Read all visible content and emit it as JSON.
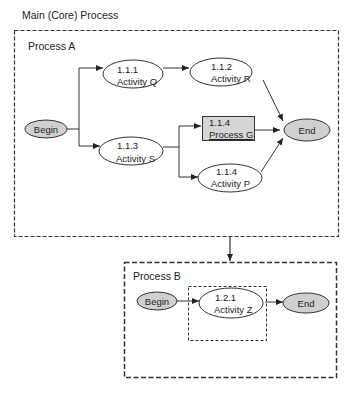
{
  "title": "Main (Core) Process",
  "process_a": {
    "label": "Process A",
    "begin": "Begin",
    "end": "End",
    "nodes": [
      {
        "id": "1.1.1",
        "label": "Activity Q",
        "shape": "ellipse"
      },
      {
        "id": "1.1.2",
        "label": "Activity R",
        "shape": "ellipse"
      },
      {
        "id": "1.1.3",
        "label": "Activity S",
        "shape": "ellipse"
      },
      {
        "id": "1.1.4",
        "label": "Process G",
        "shape": "rectangle"
      },
      {
        "id": "1.1.4",
        "label": "Activity P",
        "shape": "ellipse"
      }
    ]
  },
  "process_b": {
    "label": "Process B",
    "begin": "Begin",
    "end": "End",
    "nodes": [
      {
        "id": "1.2.1",
        "label": "Activity Z",
        "shape": "ellipse"
      }
    ]
  },
  "colors": {
    "terminal_fill": "#d0d0d0",
    "process_fill": "#d6d6d6",
    "line": "#333333"
  }
}
